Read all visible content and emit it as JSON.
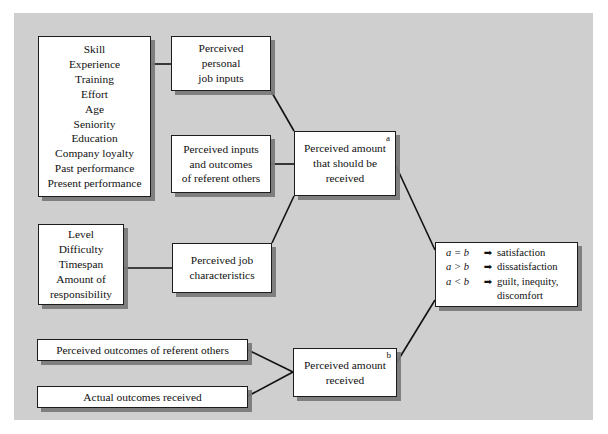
{
  "diagram": {
    "background_color": "#ffffff",
    "panel_color": "#cfcfcf",
    "box_fill": "#ffffff",
    "box_border": "#1c1c1c",
    "shadow_color": "#787878",
    "connector_color": "#111111"
  },
  "nodes": {
    "personal_inputs_list": {
      "name": "personal job inputs list",
      "lines": [
        "Skill",
        "Experience",
        "Training",
        "Effort",
        "Age",
        "Seniority",
        "Education",
        "Company loyalty",
        "Past performance",
        "Present performance"
      ]
    },
    "perceived_personal_job_inputs": {
      "name": "Perceived personal job inputs",
      "lines": [
        "Perceived",
        "personal",
        "job inputs"
      ]
    },
    "perceived_inputs_outcomes_referent": {
      "name": "Perceived inputs and outcomes of referent others",
      "lines": [
        "Perceived inputs",
        "and outcomes",
        "of referent others"
      ]
    },
    "perceived_amount_should": {
      "name": "Perceived amount that should be received",
      "lines": [
        "Perceived amount",
        "that should be",
        "received"
      ],
      "tag": "a"
    },
    "job_attrs_list": {
      "name": "job characteristics list",
      "lines": [
        "Level",
        "Difficulty",
        "Timespan",
        "Amount of",
        "responsibility"
      ]
    },
    "perceived_job_characteristics": {
      "name": "Perceived job characteristics",
      "lines": [
        "Perceived job",
        "characteristics"
      ]
    },
    "perceived_outcomes_referent": {
      "name": "Perceived outcomes of referent others",
      "lines": [
        "Perceived outcomes of referent others"
      ]
    },
    "actual_outcomes_received": {
      "name": "Actual outcomes received",
      "lines": [
        "Actual outcomes received"
      ]
    },
    "perceived_amount_received": {
      "name": "Perceived amount received",
      "lines": [
        "Perceived amount",
        "received"
      ],
      "tag": "b"
    },
    "equity_outcomes": {
      "name": "Equity comparison outcomes",
      "rows": [
        {
          "relation": "a = b",
          "arrow": "➡",
          "result": "satisfaction"
        },
        {
          "relation": "a > b",
          "arrow": "➡",
          "result": "dissatisfaction"
        },
        {
          "relation": "a < b",
          "arrow": "➡",
          "result": "guilt, inequity,"
        }
      ],
      "continuation": "discomfort"
    }
  },
  "connectors": [
    {
      "name": "inputs-list-to-perceived-personal",
      "type": "straight"
    },
    {
      "name": "perceived-personal-to-amount-should",
      "type": "diagonal"
    },
    {
      "name": "referent-inputs-to-amount-should",
      "type": "straight"
    },
    {
      "name": "job-attrs-to-job-characteristics",
      "type": "straight"
    },
    {
      "name": "job-characteristics-to-amount-should",
      "type": "diagonal"
    },
    {
      "name": "amount-should-to-equity-outcomes",
      "type": "diagonal"
    },
    {
      "name": "perceived-outcomes-referent-to-amount-received",
      "type": "diagonal"
    },
    {
      "name": "actual-outcomes-to-amount-received",
      "type": "diagonal"
    },
    {
      "name": "amount-received-to-equity-outcomes",
      "type": "diagonal"
    }
  ]
}
